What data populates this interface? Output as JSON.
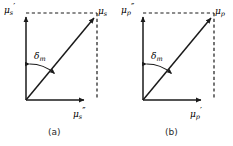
{
  "figure": {
    "background_color": "#ffffff",
    "stroke_color": "#1a1a1a",
    "caption_color": "#2a2a2a"
  },
  "panels": [
    {
      "id": "a",
      "caption": "(a)",
      "vertical_axis_label": {
        "symbol": "μ",
        "subscript": "s",
        "prime": "′"
      },
      "resultant_label": {
        "symbol": "μ",
        "subscript": "s",
        "prime": ""
      },
      "horizontal_axis_label": {
        "symbol": "μ",
        "subscript": "s",
        "prime": "″"
      },
      "angle_label": {
        "symbol": "δ",
        "subscript": "m",
        "prime": ""
      },
      "vector": {
        "origin": [
          26,
          100
        ],
        "tip": [
          97,
          14
        ],
        "vertical_component_tip": [
          26,
          13
        ],
        "horizontal_component_tip": [
          88,
          100
        ],
        "corner": [
          97,
          14
        ]
      },
      "angle_arc": {
        "from_axis": "vertical",
        "to": "resultant",
        "double_headed": true
      }
    },
    {
      "id": "b",
      "caption": "(b)",
      "vertical_axis_label": {
        "symbol": "μ",
        "subscript": "p",
        "prime": "″"
      },
      "resultant_label": {
        "symbol": "μ",
        "subscript": "p",
        "prime": ""
      },
      "horizontal_axis_label": {
        "symbol": "μ",
        "subscript": "p",
        "prime": "′"
      },
      "angle_label": {
        "symbol": "δ",
        "subscript": "m",
        "prime": ""
      },
      "vector": {
        "origin": [
          26,
          100
        ],
        "tip": [
          97,
          14
        ],
        "vertical_component_tip": [
          26,
          13
        ],
        "horizontal_component_tip": [
          88,
          100
        ],
        "corner": [
          97,
          14
        ]
      },
      "angle_arc": {
        "from_axis": "vertical",
        "to": "resultant",
        "double_headed": true
      }
    }
  ]
}
